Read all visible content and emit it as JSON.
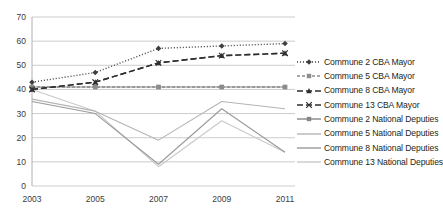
{
  "chart_data": {
    "type": "line",
    "title": "",
    "xlabel": "",
    "ylabel": "",
    "categories": [
      "2003",
      "2005",
      "2007",
      "2009",
      "2011"
    ],
    "x": [
      2003,
      2005,
      2007,
      2009,
      2011
    ],
    "ylim": [
      0,
      70
    ],
    "ytick_labels": [
      "0",
      "10",
      "20",
      "30",
      "40",
      "50",
      "60",
      "70"
    ],
    "yticks": [
      0,
      10,
      20,
      30,
      40,
      50,
      60,
      70
    ],
    "grid": true,
    "legend_position": "right",
    "series": [
      {
        "name": "Commune 2 CBA Mayor",
        "values": [
          43,
          47,
          57,
          58,
          59
        ],
        "color": "#3f3f3f",
        "style": "dotted",
        "marker": "diamond"
      },
      {
        "name": "Commune 5 CBA Mayor",
        "values": [
          41,
          41,
          41,
          41,
          41
        ],
        "color": "#8c8c8c",
        "style": "dashed-short",
        "marker": "square"
      },
      {
        "name": "Commune 8 CBA Mayor",
        "values": [
          40,
          43,
          51,
          54,
          55
        ],
        "color": "#2f2f2f",
        "style": "dashed-long",
        "marker": "triangle"
      },
      {
        "name": "Commune 13 CBA Mayor",
        "values": [
          40,
          43,
          51,
          54,
          55
        ],
        "color": "#2f2f2f",
        "style": "dashed-long",
        "marker": "cross"
      },
      {
        "name": "Commune 2 National Deputies",
        "values": [
          41,
          41,
          41,
          41,
          41
        ],
        "color": "#878787",
        "style": "solid",
        "marker": "square"
      },
      {
        "name": "Commune 5 National Deputies",
        "values": [
          36,
          31,
          19,
          35,
          32
        ],
        "color": "#b5b5b5",
        "style": "solid",
        "marker": "none"
      },
      {
        "name": "Commune 8 National Deputies",
        "values": [
          35,
          30,
          9,
          32,
          14
        ],
        "color": "#9a9a9a",
        "style": "solid",
        "marker": "none"
      },
      {
        "name": "Commune 13 National Deputies",
        "values": [
          40,
          31,
          8,
          27,
          14
        ],
        "color": "#c9c9c9",
        "style": "solid",
        "marker": "none"
      }
    ]
  },
  "legend": {
    "items": [
      {
        "label": "Commune 2 CBA Mayor"
      },
      {
        "label": "Commune 5 CBA Mayor"
      },
      {
        "label": "Commune 8 CBA Mayor"
      },
      {
        "label": "Commune 13 CBA Mayor"
      },
      {
        "label": "Commune 2 National Deputies"
      },
      {
        "label": "Commune 5 National Deputies"
      },
      {
        "label": "Commune 8 National Deputies"
      },
      {
        "label": "Commune 13 National Deputies"
      }
    ]
  },
  "colors": {
    "axis": "#b0b0b0",
    "grid": "#bfbfbf",
    "text": "#3b3b3b",
    "background": "#ffffff"
  }
}
